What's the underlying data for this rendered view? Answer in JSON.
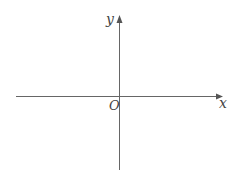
{
  "diagram": {
    "type": "cartesian-axes",
    "x_axis_label": "x",
    "y_axis_label": "y",
    "origin_label": "O",
    "axis_color": "#555555",
    "label_color": "#444444"
  }
}
